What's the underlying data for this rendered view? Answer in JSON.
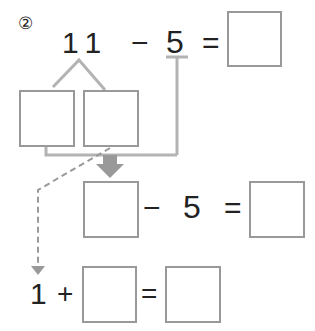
{
  "problem": {
    "number_label": "②",
    "top_equation": {
      "minuend": "11",
      "minus": "−",
      "subtrahend": "5",
      "equals": "="
    },
    "middle_equation": {
      "minus": "−",
      "subtrahend": "5",
      "equals": "="
    },
    "bottom_equation": {
      "addend": "1",
      "plus": "+",
      "equals": "="
    }
  },
  "colors": {
    "line": "#b3b3b3",
    "box_border": "#999999",
    "text": "#222222"
  }
}
